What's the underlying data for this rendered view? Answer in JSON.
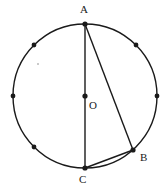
{
  "figure": {
    "stroke_color": "#1a1a1a",
    "fill_color": "#ffffff",
    "background_color": "#ffffff"
  },
  "circle": {
    "name": "main-circle",
    "center_x": 85,
    "center_y": 96,
    "radius": 72,
    "stroke_width": 1.4
  },
  "points": {
    "A": {
      "label": "A",
      "x": 85,
      "y": 24,
      "dot_radius": 2.6,
      "label_x": 80,
      "label_y": 4
    },
    "B": {
      "label": "B",
      "x": 133,
      "y": 150,
      "dot_radius": 2.6,
      "label_x": 140,
      "label_y": 152
    },
    "C": {
      "label": "C",
      "x": 85,
      "y": 168,
      "dot_radius": 2.6,
      "label_x": 79,
      "label_y": 174
    },
    "O": {
      "label": "O",
      "x": 85,
      "y": 96,
      "dot_radius": 2.6,
      "label_x": 89,
      "label_y": 100
    }
  },
  "arc_markers": [
    {
      "name": "marker-north-west",
      "x": 34,
      "y": 45,
      "radius": 2.4
    },
    {
      "name": "marker-north-east",
      "x": 136,
      "y": 45,
      "radius": 2.4
    },
    {
      "name": "marker-west",
      "x": 13,
      "y": 96,
      "radius": 2.4
    },
    {
      "name": "marker-east",
      "x": 157,
      "y": 96,
      "radius": 2.4
    },
    {
      "name": "marker-south-west",
      "x": 34,
      "y": 147,
      "radius": 2.4
    },
    {
      "name": "marker-faint-interior",
      "x": 38,
      "y": 64,
      "radius": 1.0
    }
  ],
  "chords": [
    {
      "name": "chord-AC-diameter",
      "x1": 85,
      "y1": 24,
      "x2": 85,
      "y2": 168,
      "stroke_width": 1.4
    },
    {
      "name": "chord-AB",
      "x1": 85,
      "y1": 24,
      "x2": 133,
      "y2": 150,
      "stroke_width": 1.4
    },
    {
      "name": "chord-BC",
      "x1": 133,
      "y1": 150,
      "x2": 85,
      "y2": 168,
      "stroke_width": 1.4
    }
  ]
}
